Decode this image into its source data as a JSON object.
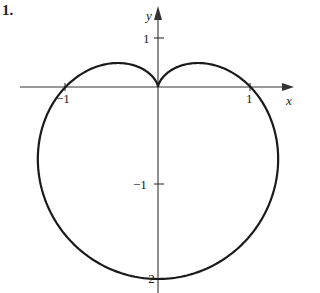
{
  "figure": {
    "number_label": "1."
  },
  "chart_data": {
    "type": "line",
    "title": "",
    "xlabel": "x",
    "ylabel": "y",
    "x_ticks": [
      -1,
      1
    ],
    "y_ticks": [
      1,
      -1,
      -2
    ],
    "tick_labels": {
      "x": [
        "-1",
        "1"
      ],
      "y": [
        "1",
        "-1",
        "-2"
      ]
    },
    "xlim": [
      -1.6,
      1.4
    ],
    "ylim": [
      -2.1,
      0.9
    ],
    "grid": false,
    "legend": null,
    "series": [
      {
        "name": "r = 1 - sin(theta)",
        "equation": "r = 1 - sin(theta)",
        "key_points": [
          {
            "x": 0,
            "y": 0,
            "note": "cusp"
          },
          {
            "x": 1,
            "y": 0
          },
          {
            "x": -1,
            "y": 0
          },
          {
            "x": 0,
            "y": -2,
            "note": "bottom"
          },
          {
            "x": 0.65,
            "y": 0.28,
            "note": "right lobe top"
          },
          {
            "x": -0.65,
            "y": 0.28,
            "note": "left lobe top"
          }
        ]
      }
    ]
  },
  "labels": {
    "x_axis": "x",
    "y_axis": "y",
    "x_neg1": "−1",
    "x_pos1": "1",
    "y_pos1": "1",
    "y_neg1": "−1",
    "y_neg2": "−2"
  },
  "colors": {
    "curve": "#1a1a1a",
    "axes": "#333333",
    "background": "#ffffff"
  }
}
